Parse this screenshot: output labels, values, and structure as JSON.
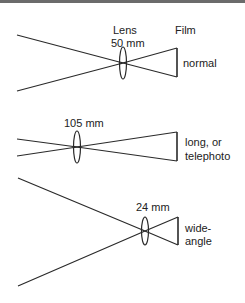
{
  "diagram": {
    "stroke_color": "#2a2a2a",
    "header_labels": {
      "lens": "Lens",
      "film": "Film"
    },
    "panels": [
      {
        "id": "normal",
        "focal_length": "50 mm",
        "type_label_lines": [
          "normal"
        ],
        "geometry": {
          "ray_start_x": 17,
          "ray_top_y": 35,
          "ray_bottom_y": 91,
          "lens_x": 123,
          "lens_y": 63,
          "lens_half_h": 16,
          "film_x": 177,
          "film_top_y": 48,
          "film_bottom_y": 77
        }
      },
      {
        "id": "telephoto",
        "focal_length": "105 mm",
        "type_label_lines": [
          "long, or",
          "telephoto"
        ],
        "geometry": {
          "ray_start_x": 17,
          "ray_top_y": 139,
          "ray_bottom_y": 156,
          "lens_x": 77,
          "lens_y": 147,
          "lens_half_h": 16,
          "film_x": 177,
          "film_top_y": 132,
          "film_bottom_y": 161
        }
      },
      {
        "id": "wide-angle",
        "focal_length": "24 mm",
        "type_label_lines": [
          "wide-",
          "angle"
        ],
        "geometry": {
          "ray_start_x": 18,
          "ray_top_y": 178,
          "ray_bottom_y": 286,
          "lens_x": 145,
          "lens_y": 231,
          "lens_half_h": 14,
          "film_x": 178,
          "film_top_y": 217,
          "film_bottom_y": 245
        }
      }
    ]
  }
}
